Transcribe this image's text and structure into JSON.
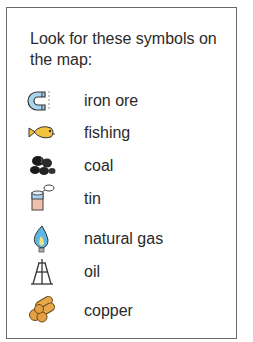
{
  "legend": {
    "title": "Look for these symbols on the map:",
    "items": [
      {
        "icon": "magnet-icon",
        "label": "iron ore"
      },
      {
        "icon": "fish-icon",
        "label": "fishing"
      },
      {
        "icon": "coal-lumps-icon",
        "label": "coal"
      },
      {
        "icon": "tin-can-icon",
        "label": "tin"
      },
      {
        "icon": "gas-flame-icon",
        "label": "natural gas"
      },
      {
        "icon": "oil-derrick-icon",
        "label": "oil"
      },
      {
        "icon": "copper-logs-icon",
        "label": "copper"
      }
    ]
  }
}
